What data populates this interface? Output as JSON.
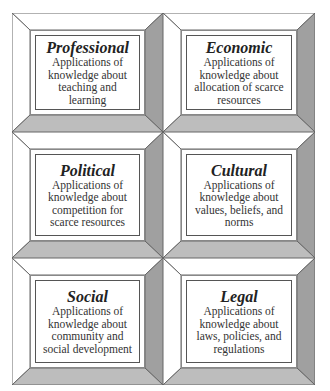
{
  "diagram": {
    "type": "grid-3x2",
    "cells": [
      {
        "title": "Professional",
        "description": "Applications of knowledge about teaching and learning"
      },
      {
        "title": "Economic",
        "description": "Applications of knowledge about allocation of scarce resources"
      },
      {
        "title": "Political",
        "description": "Applications of knowledge about competition for scarce resources"
      },
      {
        "title": "Cultural",
        "description": "Applications of knowledge about values, beliefs, and norms"
      },
      {
        "title": "Social",
        "description": "Applications of knowledge about community and social development"
      },
      {
        "title": "Legal",
        "description": "Applications of knowledge about laws, policies, and regulations"
      }
    ],
    "colors": {
      "bevel_light": "#ffffff",
      "bevel_dark_side": "#a0a0a0",
      "bevel_dark_bottom": "#bdbdbd",
      "outline": "#555555"
    }
  }
}
